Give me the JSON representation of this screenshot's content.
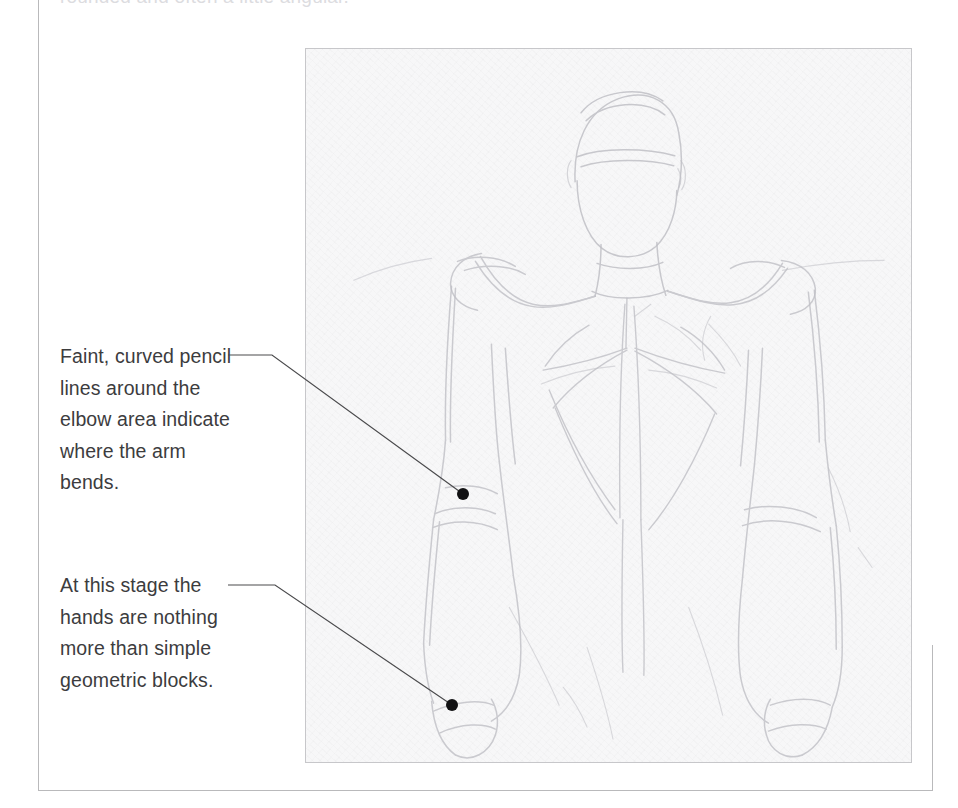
{
  "page": {
    "clipped_top_text": "rounded and often a little angular.",
    "background_color": "#ffffff",
    "border_color": "#b9b9bb"
  },
  "captions": [
    {
      "id": "elbow",
      "name": "caption-elbow",
      "text": "Faint, curved pencil lines around the elbow area indicate where the arm bends.",
      "lines": [
        "Faint, curved",
        "pencil lines",
        "around the elbow",
        "area indicate",
        "where the arm",
        "bends."
      ],
      "leader": {
        "start_x": 228,
        "start_y": 355,
        "bend_x": 272,
        "bend_y": 355,
        "end_x": 463,
        "end_y": 494,
        "dot_radius": 6,
        "line_color": "#4a4a4c",
        "dot_color": "#111113"
      }
    },
    {
      "id": "hands",
      "name": "caption-hands",
      "text": "At this stage the hands are nothing more than simple geometric blocks.",
      "lines": [
        "At this stage the",
        "hands are",
        "nothing more",
        "than simple",
        "geometric blocks."
      ],
      "leader": {
        "start_x": 228,
        "start_y": 585,
        "bend_x": 275,
        "bend_y": 585,
        "end_x": 452,
        "end_y": 705,
        "dot_radius": 6,
        "line_color": "#4a4a4c",
        "dot_color": "#111113"
      }
    }
  ],
  "artwork": {
    "name": "pencil-figure-sketch",
    "alt": "Faint graphite pencil construction sketch of a male figure seen from behind, showing head, neck, shoulders, back, arms and blocked-in hands",
    "subject": "male torso back view",
    "medium": "graphite pencil on textured paper",
    "paper_color": "#f7f7f8",
    "pencil_color": "#bdbdc2",
    "frame_color": "#c7c7ca",
    "bounds": {
      "x": 305,
      "y": 48,
      "width": 607,
      "height": 715
    }
  }
}
